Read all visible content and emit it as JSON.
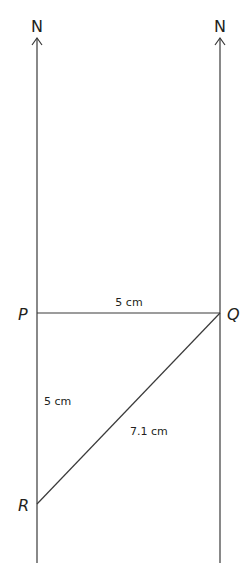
{
  "diagram": {
    "north_labels": [
      "N",
      "N"
    ],
    "points": {
      "P": "P",
      "Q": "Q",
      "R": "R"
    },
    "measurements": {
      "PQ": "5 cm",
      "PR": "5 cm",
      "QR": "7.1 cm"
    },
    "colors": {
      "line": "#3a3a3a",
      "text": "#231f20",
      "background": "#ffffff"
    }
  }
}
